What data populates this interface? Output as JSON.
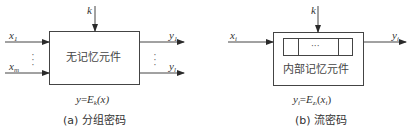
{
  "figure_a": {
    "key_label": "k",
    "inputs": [
      {
        "var": "x",
        "sub": "1"
      },
      {
        "var": "x",
        "sub": "m"
      }
    ],
    "outputs": [
      {
        "var": "y",
        "sub": "1"
      },
      {
        "var": "y",
        "sub": "l"
      }
    ],
    "box_label": "无记忆元件",
    "formula": {
      "lhs": "y",
      "eq": "=",
      "func": "E",
      "func_sub": "k",
      "arg": "(x)"
    },
    "caption": "(a) 分组密码"
  },
  "figure_b": {
    "key_label": "k",
    "input": {
      "var": "x",
      "sub": "i"
    },
    "output": {
      "var": "y",
      "sub": "i"
    },
    "register_middle": "···",
    "box_label": "内部记忆元件",
    "formula": {
      "lhs": "y",
      "lhs_sub": "i",
      "eq": "=",
      "func": "E",
      "func_sub": "z",
      "func_sub_sub": "i",
      "arg_open": "(",
      "arg": "x",
      "arg_sub": "i",
      "arg_close": ")"
    },
    "caption": "(b) 流密码"
  },
  "colors": {
    "line": "#3a3a3a",
    "text": "#333333"
  }
}
